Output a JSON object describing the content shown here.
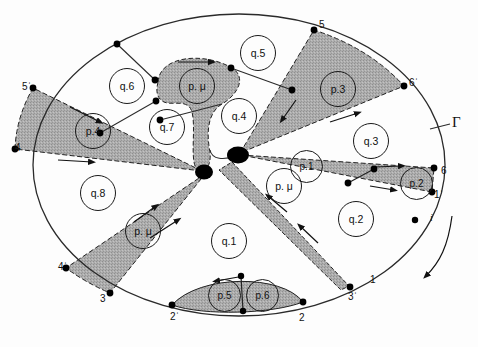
{
  "figure": {
    "boundary_label": "Γ",
    "boundary_label_name": "Gamma",
    "orientation_marker": "i",
    "colors": {
      "shade": "#a9a9a9",
      "line": "#1a1a1a",
      "background": "#ffffff",
      "node": "#000000"
    }
  },
  "cells": {
    "q_regions": [
      {
        "id": "q.1",
        "label": "q.1",
        "x": 228,
        "y": 240
      },
      {
        "id": "q.2",
        "label": "q.2",
        "x": 355,
        "y": 218
      },
      {
        "id": "q.3",
        "label": "q.3",
        "x": 370,
        "y": 140
      },
      {
        "id": "q.4",
        "label": "q.4",
        "x": 238,
        "y": 115
      },
      {
        "id": "q.5",
        "label": "q.5",
        "x": 257,
        "y": 52
      },
      {
        "id": "q.6",
        "label": "q.6",
        "x": 126,
        "y": 85
      },
      {
        "id": "q.7",
        "label": "q.7",
        "x": 166,
        "y": 126
      },
      {
        "id": "q.8",
        "label": "q.8",
        "x": 97,
        "y": 192
      }
    ],
    "p_regions": [
      {
        "id": "p.1",
        "label": "p.1",
        "x": 305,
        "y": 165
      },
      {
        "id": "p.2",
        "label": "p.2",
        "x": 415,
        "y": 182
      },
      {
        "id": "p.3",
        "label": "p.3",
        "x": 337,
        "y": 88
      },
      {
        "id": "p.4",
        "label": "p.4",
        "x": 92,
        "y": 130
      },
      {
        "id": "p.5",
        "label": "p.5",
        "x": 223,
        "y": 294
      },
      {
        "id": "p.6",
        "label": "p.6",
        "x": 261,
        "y": 294
      },
      {
        "id": "p.mu.top",
        "label": "p. μ",
        "x": 196,
        "y": 85
      },
      {
        "id": "p.mu.left",
        "label": "p. μ",
        "x": 142,
        "y": 230
      },
      {
        "id": "p.mu.right",
        "label": "p. μ",
        "x": 283,
        "y": 185
      }
    ]
  },
  "boundary_marks": [
    {
      "id": "m4",
      "label": "4",
      "x": 15,
      "y": 143
    },
    {
      "id": "m5p",
      "label": "5ˈ",
      "x": 22,
      "y": 82
    },
    {
      "id": "m5",
      "label": "5",
      "x": 319,
      "y": 20
    },
    {
      "id": "m6p",
      "label": "6ˈ",
      "x": 409,
      "y": 78
    },
    {
      "id": "m6",
      "label": "6",
      "x": 441,
      "y": 166
    },
    {
      "id": "m1p",
      "label": "1ˈ",
      "x": 434,
      "y": 190
    },
    {
      "id": "m1",
      "label": "1",
      "x": 370,
      "y": 275
    },
    {
      "id": "m3p",
      "label": "3ˈ",
      "x": 348,
      "y": 292
    },
    {
      "id": "m2",
      "label": "2",
      "x": 299,
      "y": 313
    },
    {
      "id": "m2p",
      "label": "2ˈ",
      "x": 170,
      "y": 312
    },
    {
      "id": "m3",
      "label": "3",
      "x": 100,
      "y": 294
    },
    {
      "id": "m4p",
      "label": "4ˈ",
      "x": 58,
      "y": 262
    }
  ]
}
